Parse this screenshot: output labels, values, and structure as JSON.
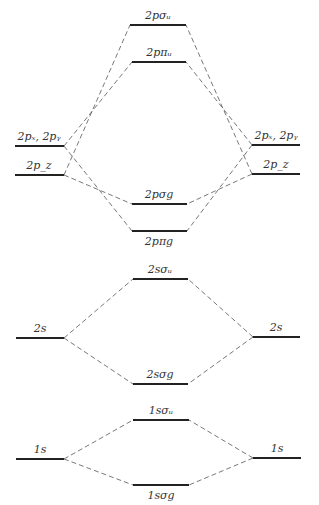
{
  "diagram": {
    "levels": [
      {
        "id": "L2pxy",
        "label": "2pₓ, 2pᵧ",
        "x1": 15,
        "x2": 64,
        "y": 146,
        "lx": 39,
        "ly": 140
      },
      {
        "id": "L2pz",
        "label": "2p_z",
        "x1": 15,
        "x2": 64,
        "y": 175,
        "lx": 39,
        "ly": 169
      },
      {
        "id": "R2pxy",
        "label": "2pₓ, 2pᵧ",
        "x1": 252,
        "x2": 300,
        "y": 145,
        "lx": 276,
        "ly": 139
      },
      {
        "id": "R2pz",
        "label": "2p_z",
        "x1": 252,
        "x2": 300,
        "y": 174,
        "lx": 276,
        "ly": 168
      },
      {
        "id": "s2pu",
        "label": "2pσᵤ",
        "x1": 130,
        "x2": 186,
        "y": 25,
        "lx": 158,
        "ly": 19
      },
      {
        "id": "p2pu",
        "label": "2pπᵤ",
        "x1": 132,
        "x2": 186,
        "y": 62,
        "lx": 159,
        "ly": 56
      },
      {
        "id": "s2pg",
        "label": "2pσg",
        "x1": 132,
        "x2": 187,
        "y": 204,
        "lx": 159,
        "ly": 198
      },
      {
        "id": "p2pg",
        "label": "2pπg",
        "x1": 132,
        "x2": 187,
        "y": 231,
        "lx": 159,
        "ly": 245
      },
      {
        "id": "L2s",
        "label": "2s",
        "x1": 16,
        "x2": 64,
        "y": 338,
        "lx": 40,
        "ly": 332
      },
      {
        "id": "R2s",
        "label": "2s",
        "x1": 253,
        "x2": 300,
        "y": 337,
        "lx": 276,
        "ly": 331
      },
      {
        "id": "s2su",
        "label": "2sσᵤ",
        "x1": 133,
        "x2": 188,
        "y": 279,
        "lx": 160,
        "ly": 273
      },
      {
        "id": "s2sg",
        "label": "2sσg",
        "x1": 133,
        "x2": 188,
        "y": 384,
        "lx": 160,
        "ly": 378
      },
      {
        "id": "L1s",
        "label": "1s",
        "x1": 16,
        "x2": 64,
        "y": 459,
        "lx": 40,
        "ly": 453
      },
      {
        "id": "R1s",
        "label": "1s",
        "x1": 253,
        "x2": 301,
        "y": 458,
        "lx": 277,
        "ly": 452
      },
      {
        "id": "s1su",
        "label": "1sσᵤ",
        "x1": 133,
        "x2": 189,
        "y": 420,
        "lx": 161,
        "ly": 414
      },
      {
        "id": "s1sg",
        "label": "1sσg",
        "x1": 133,
        "x2": 189,
        "y": 485,
        "lx": 161,
        "ly": 499
      }
    ],
    "connections": [
      [
        "L2pxy",
        "p2pu"
      ],
      [
        "L2pxy",
        "p2pg"
      ],
      [
        "L2pz",
        "s2pu"
      ],
      [
        "L2pz",
        "s2pg"
      ],
      [
        "R2pxy",
        "p2pu"
      ],
      [
        "R2pxy",
        "p2pg"
      ],
      [
        "R2pz",
        "s2pu"
      ],
      [
        "R2pz",
        "s2pg"
      ],
      [
        "L2s",
        "s2su"
      ],
      [
        "L2s",
        "s2sg"
      ],
      [
        "R2s",
        "s2su"
      ],
      [
        "R2s",
        "s2sg"
      ],
      [
        "L1s",
        "s1su"
      ],
      [
        "L1s",
        "s1sg"
      ],
      [
        "R1s",
        "s1su"
      ],
      [
        "R1s",
        "s1sg"
      ]
    ]
  }
}
